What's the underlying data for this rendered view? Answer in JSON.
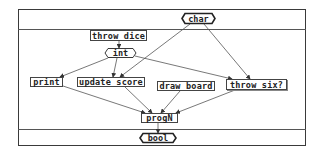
{
  "diagram": {
    "input_type": {
      "label": "char",
      "shape": "hexagon"
    },
    "output_type": {
      "label": "bool",
      "shape": "hexagon"
    },
    "nodes": [
      {
        "id": "throw_dice",
        "label": "throw dice",
        "shape": "box"
      },
      {
        "id": "int",
        "label": "int",
        "shape": "hexagon"
      },
      {
        "id": "print",
        "label": "print",
        "shape": "box"
      },
      {
        "id": "update_score",
        "label": "update score",
        "shape": "box"
      },
      {
        "id": "draw_board",
        "label": "draw board",
        "shape": "box"
      },
      {
        "id": "throw_six",
        "label": "throw six?",
        "shape": "box"
      },
      {
        "id": "progN",
        "label": "progN",
        "shape": "box"
      }
    ],
    "edges": [
      {
        "from": "throw dice",
        "to": "int"
      },
      {
        "from": "int",
        "to": "print"
      },
      {
        "from": "int",
        "to": "update score"
      },
      {
        "from": "int",
        "to": "throw six?"
      },
      {
        "from": "char",
        "to": "update score"
      },
      {
        "from": "char",
        "to": "throw six?"
      },
      {
        "from": "print",
        "to": "progN"
      },
      {
        "from": "update score",
        "to": "progN"
      },
      {
        "from": "draw board",
        "to": "progN"
      },
      {
        "from": "throw six?",
        "to": "progN"
      },
      {
        "from": "progN",
        "to": "bool"
      }
    ],
    "colors": {
      "line": "#555555",
      "border": "#3a3a3a",
      "text": "#222222"
    }
  }
}
